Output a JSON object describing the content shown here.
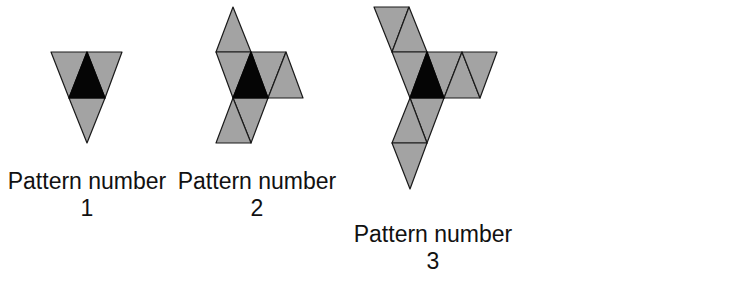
{
  "figure": {
    "colors": {
      "background": "#ffffff",
      "tile_gray": "#a3a3a3",
      "tile_center": "#050505",
      "edge": "#1a1a1a"
    },
    "patterns": [
      {
        "label": "Pattern number",
        "number": "1",
        "center_triangle": "black",
        "gray_triangles": 3
      },
      {
        "label": "Pattern number",
        "number": "2",
        "center_triangle": "black",
        "gray_triangles": 9
      },
      {
        "label": "Pattern number",
        "number": "3",
        "center_triangle": "black",
        "gray_triangles": 15
      }
    ]
  }
}
